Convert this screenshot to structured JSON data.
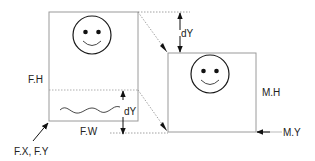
{
  "diagram": {
    "type": "viewport-scroll-mapping",
    "colors": {
      "stroke": "#1a1a1a",
      "box_stroke": "#9a9a9a",
      "dotted": "#8a8a8a",
      "text": "#222222"
    },
    "frame_box": {
      "label_height": "F.H",
      "label_width": "F.W",
      "label_origin": "F.X, F.Y"
    },
    "mapped_box": {
      "label_height": "M.H",
      "label_y": "M.Y"
    },
    "offsets": {
      "top_dy_label": "dY",
      "bottom_dy_label": "dY"
    },
    "icons": {
      "frame_content": "smiley-face-icon",
      "mapped_content": "smiley-face-icon",
      "scribble": "wavy-line-icon"
    }
  }
}
